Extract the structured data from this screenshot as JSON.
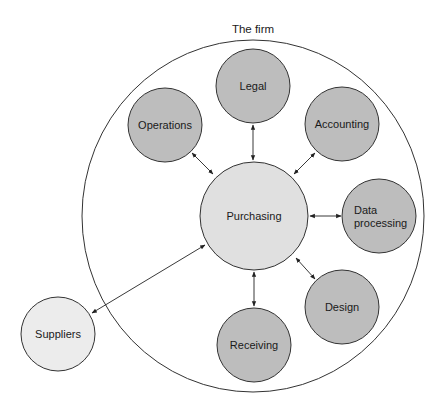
{
  "diagram": {
    "title": "The firm",
    "colors": {
      "department_fill": "#bdbdbd",
      "hub_fill": "#e0e0e0",
      "external_fill": "#ececec",
      "stroke": "#333333",
      "background": "#ffffff"
    },
    "boundary": {
      "label": "The firm",
      "cx": 253,
      "cy": 216,
      "rx": 171,
      "ry": 176
    },
    "hub": {
      "id": "purchasing",
      "label": "Purchasing",
      "cx": 254,
      "cy": 216,
      "r": 54
    },
    "departments": [
      {
        "id": "legal",
        "label": "Legal",
        "lines": [
          "Legal"
        ],
        "cx": 253,
        "cy": 86,
        "r": 37
      },
      {
        "id": "operations",
        "label": "Operations",
        "lines": [
          "Operations"
        ],
        "cx": 165,
        "cy": 125,
        "r": 37
      },
      {
        "id": "accounting",
        "label": "Accounting",
        "lines": [
          "Accounting"
        ],
        "cx": 342,
        "cy": 124,
        "r": 37
      },
      {
        "id": "data-processing",
        "label": "Data processing",
        "lines": [
          "Data",
          "processing"
        ],
        "cx": 379,
        "cy": 216,
        "r": 37
      },
      {
        "id": "design",
        "label": "Design",
        "lines": [
          "Design"
        ],
        "cx": 342,
        "cy": 307,
        "r": 37
      },
      {
        "id": "receiving",
        "label": "Receiving",
        "lines": [
          "Receiving"
        ],
        "cx": 254,
        "cy": 345,
        "r": 37
      }
    ],
    "external": [
      {
        "id": "suppliers",
        "label": "Suppliers",
        "lines": [
          "Suppliers"
        ],
        "cx": 58,
        "cy": 334,
        "r": 37
      }
    ],
    "connections": [
      {
        "from": "purchasing",
        "to": "legal",
        "x1": 253,
        "y1": 160,
        "x2": 253,
        "y2": 125,
        "bidirectional": true
      },
      {
        "from": "purchasing",
        "to": "operations",
        "x1": 213,
        "y1": 174,
        "x2": 192,
        "y2": 153,
        "bidirectional": true
      },
      {
        "from": "purchasing",
        "to": "accounting",
        "x1": 294,
        "y1": 174,
        "x2": 315,
        "y2": 153,
        "bidirectional": true
      },
      {
        "from": "purchasing",
        "to": "data-processing",
        "x1": 310,
        "y1": 216,
        "x2": 341,
        "y2": 216,
        "bidirectional": true
      },
      {
        "from": "purchasing",
        "to": "design",
        "x1": 296,
        "y1": 258,
        "x2": 315,
        "y2": 279,
        "bidirectional": true
      },
      {
        "from": "purchasing",
        "to": "receiving",
        "x1": 254,
        "y1": 272,
        "x2": 254,
        "y2": 306,
        "bidirectional": true
      },
      {
        "from": "purchasing",
        "to": "suppliers",
        "x1": 205,
        "y1": 245,
        "x2": 92,
        "y2": 313,
        "bidirectional": true
      }
    ]
  }
}
